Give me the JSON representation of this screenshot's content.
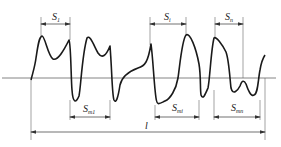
{
  "diagram": {
    "type": "surface-roughness-profile",
    "labels": {
      "s1": "S",
      "s1_sub": "1",
      "si": "S",
      "si_sub": "i",
      "sn": "S",
      "sn_sub": "n",
      "sm1": "S",
      "sm1_sub": "m1",
      "smi": "S",
      "smi_sub": "mi",
      "smn": "S",
      "smn_sub": "mn",
      "l": "l"
    },
    "colors": {
      "profile": "#1a1a1a",
      "lines": "#555555",
      "background": "#ffffff"
    }
  }
}
